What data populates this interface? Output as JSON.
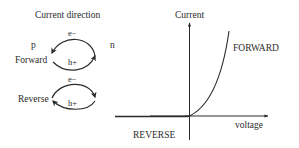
{
  "left_panel": {
    "title": "Current direction",
    "p_label": "p",
    "n_label": "n",
    "forward": {
      "label": "Forward",
      "electron_label": "e−",
      "hole_label": "h+"
    },
    "reverse": {
      "label": "Reverse",
      "electron_label": "e−",
      "hole_label": "h+"
    }
  },
  "graph": {
    "y_axis_label": "Current",
    "x_axis_label": "voltage",
    "forward_label": "FORWARD",
    "reverse_label": "REVERSE"
  },
  "colors": {
    "line": "#2a2a2a",
    "background": "#ffffff"
  }
}
